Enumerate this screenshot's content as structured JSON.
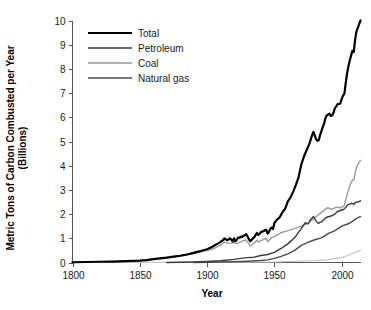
{
  "chart_data": {
    "type": "line",
    "title": "",
    "xlabel": "Year",
    "ylabel": "Metric Tons of Carbon Combusted per Year (Billions)",
    "ylabel_line1": "Metric Tons of Carbon Combusted per Year",
    "ylabel_line2": "(Billions)",
    "xlim": [
      1800,
      2014
    ],
    "ylim": [
      0,
      10
    ],
    "grid": false,
    "legend_position": "top-left",
    "xticks": [
      1800,
      1850,
      1900,
      1950,
      2000
    ],
    "xtick_labels": [
      "1800",
      "1850",
      "1900",
      "1950",
      "2000"
    ],
    "yticks": [
      0,
      1,
      2,
      3,
      4,
      5,
      6,
      7,
      8,
      9,
      10
    ],
    "ytick_labels": [
      "0",
      "1",
      "2",
      "3",
      "4",
      "5",
      "6",
      "7",
      "8",
      "9",
      "10"
    ],
    "series": [
      {
        "name": "Total",
        "color": "#000000",
        "width": 2.2,
        "x": [
          1800,
          1810,
          1820,
          1830,
          1840,
          1850,
          1855,
          1860,
          1865,
          1870,
          1875,
          1880,
          1885,
          1890,
          1895,
          1900,
          1902,
          1904,
          1906,
          1908,
          1910,
          1912,
          1913,
          1914,
          1915,
          1916,
          1917,
          1918,
          1919,
          1920,
          1921,
          1922,
          1923,
          1924,
          1925,
          1926,
          1927,
          1928,
          1929,
          1930,
          1931,
          1932,
          1933,
          1934,
          1935,
          1936,
          1937,
          1938,
          1939,
          1940,
          1941,
          1942,
          1943,
          1944,
          1945,
          1946,
          1947,
          1948,
          1949,
          1950,
          1952,
          1954,
          1956,
          1958,
          1960,
          1962,
          1964,
          1966,
          1968,
          1970,
          1972,
          1974,
          1976,
          1978,
          1979,
          1980,
          1981,
          1982,
          1983,
          1984,
          1985,
          1986,
          1987,
          1988,
          1989,
          1990,
          1991,
          1992,
          1993,
          1994,
          1995,
          1996,
          1997,
          1998,
          1999,
          2000,
          2001,
          2002,
          2003,
          2004,
          2005,
          2006,
          2007,
          2008,
          2009,
          2010,
          2011,
          2012,
          2013,
          2014
        ],
        "y": [
          0.01,
          0.02,
          0.03,
          0.04,
          0.06,
          0.08,
          0.1,
          0.14,
          0.17,
          0.2,
          0.24,
          0.28,
          0.33,
          0.4,
          0.47,
          0.55,
          0.6,
          0.65,
          0.72,
          0.78,
          0.85,
          0.93,
          1.0,
          0.96,
          0.92,
          0.95,
          1.0,
          0.95,
          0.87,
          1.0,
          0.88,
          0.93,
          1.03,
          1.02,
          1.07,
          1.05,
          1.11,
          1.12,
          1.17,
          1.08,
          0.97,
          0.88,
          0.92,
          1.0,
          1.04,
          1.13,
          1.22,
          1.14,
          1.19,
          1.25,
          1.29,
          1.29,
          1.34,
          1.35,
          1.19,
          1.27,
          1.39,
          1.44,
          1.38,
          1.63,
          1.77,
          1.87,
          2.08,
          2.22,
          2.53,
          2.69,
          2.93,
          3.21,
          3.53,
          4.05,
          4.38,
          4.65,
          4.9,
          5.25,
          5.4,
          5.25,
          5.1,
          5.03,
          5.05,
          5.27,
          5.44,
          5.6,
          5.75,
          5.97,
          6.08,
          6.12,
          6.15,
          6.05,
          6.08,
          6.2,
          6.38,
          6.45,
          6.55,
          6.55,
          6.57,
          6.75,
          6.9,
          6.97,
          7.4,
          7.8,
          8.1,
          8.35,
          8.55,
          8.75,
          8.7,
          9.2,
          9.55,
          9.7,
          9.85,
          10.0
        ]
      },
      {
        "name": "Petroleum",
        "color": "#3a3a3a",
        "width": 1.4,
        "x": [
          1870,
          1880,
          1890,
          1900,
          1910,
          1920,
          1925,
          1930,
          1935,
          1940,
          1945,
          1950,
          1955,
          1960,
          1965,
          1970,
          1973,
          1975,
          1977,
          1979,
          1980,
          1981,
          1982,
          1983,
          1984,
          1985,
          1986,
          1987,
          1988,
          1989,
          1990,
          1991,
          1992,
          1993,
          1994,
          1995,
          1996,
          1997,
          1998,
          1999,
          2000,
          2001,
          2002,
          2003,
          2004,
          2005,
          2006,
          2007,
          2008,
          2009,
          2010,
          2011,
          2012,
          2013,
          2014
        ],
        "y": [
          0.0,
          0.01,
          0.02,
          0.04,
          0.07,
          0.13,
          0.17,
          0.2,
          0.22,
          0.29,
          0.33,
          0.42,
          0.58,
          0.77,
          1.02,
          1.4,
          1.65,
          1.6,
          1.78,
          1.9,
          1.8,
          1.72,
          1.65,
          1.62,
          1.67,
          1.67,
          1.73,
          1.78,
          1.84,
          1.87,
          1.89,
          1.9,
          1.93,
          1.93,
          1.97,
          2.0,
          2.06,
          2.12,
          2.12,
          2.15,
          2.17,
          2.18,
          2.22,
          2.27,
          2.36,
          2.39,
          2.41,
          2.45,
          2.44,
          2.4,
          2.47,
          2.49,
          2.5,
          2.52,
          2.55
        ]
      },
      {
        "name": "Coal",
        "color": "#9a9a9a",
        "width": 1.4,
        "x": [
          1800,
          1810,
          1820,
          1830,
          1840,
          1850,
          1860,
          1870,
          1880,
          1890,
          1900,
          1905,
          1910,
          1913,
          1915,
          1918,
          1920,
          1922,
          1925,
          1927,
          1929,
          1930,
          1932,
          1935,
          1937,
          1938,
          1940,
          1942,
          1944,
          1945,
          1946,
          1948,
          1950,
          1955,
          1960,
          1965,
          1970,
          1975,
          1980,
          1985,
          1989,
          1990,
          1992,
          1994,
          1996,
          1998,
          1999,
          2000,
          2001,
          2002,
          2003,
          2004,
          2005,
          2006,
          2007,
          2008,
          2009,
          2010,
          2011,
          2012,
          2013,
          2014
        ],
        "y": [
          0.01,
          0.02,
          0.03,
          0.04,
          0.06,
          0.08,
          0.13,
          0.19,
          0.26,
          0.37,
          0.5,
          0.57,
          0.72,
          0.85,
          0.79,
          0.81,
          0.82,
          0.78,
          0.85,
          0.9,
          0.93,
          0.85,
          0.68,
          0.81,
          0.92,
          0.84,
          0.9,
          0.95,
          1.0,
          0.86,
          0.91,
          1.03,
          1.07,
          1.23,
          1.32,
          1.4,
          1.5,
          1.62,
          1.85,
          2.07,
          2.25,
          2.26,
          2.2,
          2.23,
          2.29,
          2.27,
          2.25,
          2.3,
          2.3,
          2.36,
          2.6,
          2.8,
          2.98,
          3.15,
          3.3,
          3.4,
          3.42,
          3.67,
          3.92,
          4.05,
          4.15,
          4.22
        ]
      },
      {
        "name": "Natural gas",
        "color": "#4a4a4a",
        "width": 1.4,
        "x": [
          1890,
          1900,
          1910,
          1920,
          1930,
          1940,
          1945,
          1950,
          1955,
          1960,
          1965,
          1970,
          1975,
          1980,
          1985,
          1990,
          1995,
          2000,
          2005,
          2008,
          2010,
          2012,
          2014
        ],
        "y": [
          0.0,
          0.01,
          0.02,
          0.03,
          0.05,
          0.08,
          0.11,
          0.17,
          0.25,
          0.36,
          0.5,
          0.71,
          0.83,
          0.94,
          1.02,
          1.19,
          1.32,
          1.5,
          1.6,
          1.7,
          1.78,
          1.85,
          1.9
        ]
      }
    ],
    "minor_series": [
      {
        "name": "other",
        "color": "#c6c6c6",
        "width": 1.2,
        "x": [
          1800,
          1900,
          1950,
          1980,
          1990,
          2000,
          2005,
          2010,
          2014
        ],
        "y": [
          0.0,
          0.005,
          0.02,
          0.08,
          0.12,
          0.2,
          0.3,
          0.42,
          0.5
        ]
      }
    ]
  },
  "legend": {
    "entries": [
      {
        "label": "Total"
      },
      {
        "label": "Petroleum"
      },
      {
        "label": "Coal"
      },
      {
        "label": "Natural gas"
      }
    ]
  }
}
